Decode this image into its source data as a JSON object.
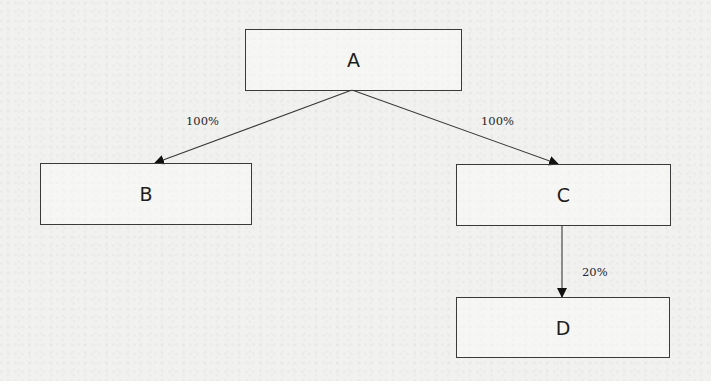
{
  "diagram": {
    "type": "ownership-structure",
    "nodes": [
      {
        "id": "A",
        "label": "A"
      },
      {
        "id": "B",
        "label": "B"
      },
      {
        "id": "C",
        "label": "C"
      },
      {
        "id": "D",
        "label": "D"
      }
    ],
    "edges": [
      {
        "from": "A",
        "to": "B",
        "label": "100%"
      },
      {
        "from": "A",
        "to": "C",
        "label": "100%"
      },
      {
        "from": "C",
        "to": "D",
        "label": "20%"
      }
    ]
  },
  "colors": {
    "background": "#f1f1ef",
    "line": "#3a3a3a",
    "text": "#1e1e1e"
  }
}
